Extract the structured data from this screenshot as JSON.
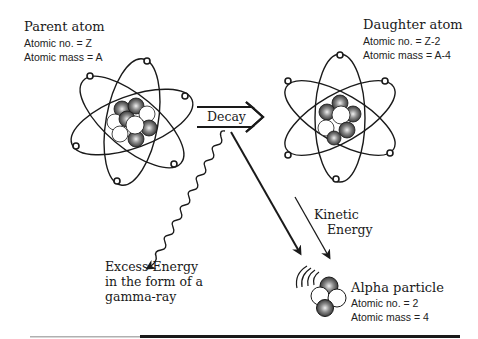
{
  "parent_atom": {
    "title": "Parent atom",
    "atomic_number": "Atomic no. = Z",
    "atomic_mass": "Atomic mass = A"
  },
  "daughter_atom": {
    "title": "Daughter atom",
    "atomic_number": "Atomic no. = Z-2",
    "atomic_mass": "Atomic mass = A-4"
  },
  "decay_arrow": {
    "label": "Decay"
  },
  "gamma_ray": {
    "line1": "Excess Energy",
    "line2": "in the form of a",
    "line3": "gamma-ray"
  },
  "kinetic_energy": {
    "line1": "Kinetic",
    "line2": "Energy"
  },
  "alpha_particle": {
    "title": "Alpha particle",
    "atomic_number": "Atomic no. = 2",
    "atomic_mass": "Atomic mass = 4"
  },
  "colors": {
    "ink": "#1a1a1a",
    "background": "#ffffff",
    "proton_shade": "#555555"
  }
}
